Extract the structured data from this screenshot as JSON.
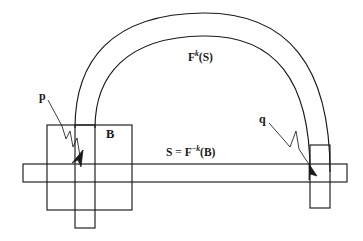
{
  "figure": {
    "background_color": "#ffffff",
    "stroke_color": "#1a1a1a",
    "labels": {
      "point_p": "p",
      "point_q": "q",
      "box_B": "B",
      "image_forward": {
        "base": "F",
        "exponent": "k",
        "argument": "(S)",
        "full": "F^k(S)"
      },
      "strip_S": {
        "lhs": "S",
        "equals": "=",
        "base": "F",
        "exponent": "−k",
        "argument": "(B)",
        "full": "S = F^-k(B)"
      }
    },
    "shapes": {
      "horizontal_bar": {
        "x": 23,
        "y": 164,
        "width": 324,
        "height": 18
      },
      "box_B": {
        "x": 47,
        "y": 125,
        "width": 85,
        "height": 85
      },
      "left_vertical_strip": {
        "x": 75,
        "y": 125,
        "width": 20,
        "height": 103
      },
      "right_vertical_strip": {
        "x": 310,
        "y": 145,
        "width": 20,
        "height": 63
      },
      "arch_outer_apex_y": 13,
      "arch_inner_apex_y": 36,
      "arch_left_legs_x": [
        75,
        95
      ],
      "arch_right_legs_x": [
        310,
        330
      ]
    },
    "annotations": [
      {
        "name": "p-leader",
        "from": [
          47,
          99
        ],
        "to": [
          79,
          171
        ],
        "style": "squiggle-arrow"
      },
      {
        "name": "q-leader",
        "from": [
          268,
          122
        ],
        "to": [
          315,
          172
        ],
        "style": "squiggle-arrow"
      }
    ]
  }
}
